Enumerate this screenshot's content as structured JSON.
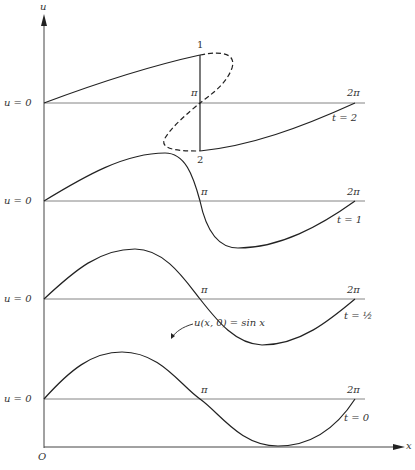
{
  "axes": {
    "y_label": "u",
    "x_label": "x",
    "origin_label": "O"
  },
  "panels": [
    {
      "id": "t2",
      "time_label": "t = 2",
      "baseline_label": "u = 0",
      "pi_label": "π",
      "two_pi_label": "2π",
      "shock_top_label": "1",
      "shock_bottom_label": "2"
    },
    {
      "id": "t1",
      "time_label": "t = 1",
      "baseline_label": "u = 0",
      "pi_label": "π",
      "two_pi_label": "2π"
    },
    {
      "id": "thalf",
      "time_label": "t = ½",
      "baseline_label": "u = 0",
      "pi_label": "π",
      "two_pi_label": "2π"
    },
    {
      "id": "t0",
      "time_label": "t = 0",
      "baseline_label": "u = 0",
      "pi_label": "π",
      "two_pi_label": "2π",
      "curve_annotation": "u(x, 0) = sin x"
    }
  ],
  "colors": {
    "stroke": "#222222",
    "axis": "#555555",
    "baseline": "#777777"
  }
}
